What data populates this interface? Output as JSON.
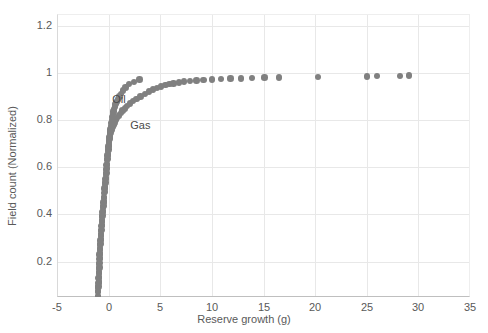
{
  "chart_data": {
    "type": "scatter",
    "title": "",
    "xlabel": "Reserve growth (g)",
    "ylabel": "Field count (Normalized)",
    "xlim": [
      -5,
      35
    ],
    "ylim": [
      0.05,
      1.25
    ],
    "xticks": [
      -5,
      0,
      5,
      10,
      15,
      20,
      25,
      30,
      35
    ],
    "xtick_labels": [
      "-5",
      "0",
      "5",
      "10",
      "15",
      "20",
      "25",
      "30",
      "35"
    ],
    "yticks": [
      0.2,
      0.4,
      0.6,
      0.8,
      1,
      1.2
    ],
    "ytick_labels": [
      "0.2",
      "0.4",
      "0.6",
      "0.8",
      "1",
      "1.2"
    ],
    "grid": true,
    "legend_position": "inline-annotation",
    "marker_color": "#808080",
    "marker_size": 3.2,
    "annotations": [
      {
        "text": "Oil",
        "x": 0.35,
        "y": 0.885
      },
      {
        "text": "Gas",
        "x": 2.1,
        "y": 0.775
      }
    ],
    "series": [
      {
        "name": "Oil",
        "color": "#808080",
        "points": [
          [
            -1.02,
            0.055
          ],
          [
            -1.0,
            0.075
          ],
          [
            -0.98,
            0.095
          ],
          [
            -0.96,
            0.115
          ],
          [
            -0.94,
            0.135
          ],
          [
            -0.92,
            0.155
          ],
          [
            -0.9,
            0.175
          ],
          [
            -0.88,
            0.195
          ],
          [
            -0.86,
            0.215
          ],
          [
            -0.84,
            0.235
          ],
          [
            -0.81,
            0.255
          ],
          [
            -0.78,
            0.275
          ],
          [
            -0.75,
            0.295
          ],
          [
            -0.72,
            0.315
          ],
          [
            -0.69,
            0.335
          ],
          [
            -0.66,
            0.355
          ],
          [
            -0.62,
            0.375
          ],
          [
            -0.58,
            0.395
          ],
          [
            -0.54,
            0.415
          ],
          [
            -0.5,
            0.435
          ],
          [
            -0.46,
            0.455
          ],
          [
            -0.42,
            0.475
          ],
          [
            -0.38,
            0.495
          ],
          [
            -0.34,
            0.515
          ],
          [
            -0.3,
            0.535
          ],
          [
            -0.26,
            0.555
          ],
          [
            -0.22,
            0.575
          ],
          [
            -0.18,
            0.595
          ],
          [
            -0.14,
            0.615
          ],
          [
            -0.1,
            0.635
          ],
          [
            -0.06,
            0.655
          ],
          [
            -0.02,
            0.675
          ],
          [
            0.02,
            0.695
          ],
          [
            0.06,
            0.712
          ],
          [
            0.1,
            0.728
          ],
          [
            0.14,
            0.744
          ],
          [
            0.18,
            0.76
          ],
          [
            0.22,
            0.774
          ],
          [
            0.26,
            0.788
          ],
          [
            0.3,
            0.8
          ],
          [
            0.35,
            0.812
          ],
          [
            0.4,
            0.824
          ],
          [
            0.46,
            0.836
          ],
          [
            0.53,
            0.848
          ],
          [
            0.6,
            0.858
          ],
          [
            0.68,
            0.868
          ],
          [
            0.78,
            0.878
          ],
          [
            0.9,
            0.888
          ],
          [
            1.05,
            0.9
          ],
          [
            1.2,
            0.912
          ],
          [
            1.4,
            0.925
          ],
          [
            1.65,
            0.938
          ],
          [
            2.0,
            0.952
          ],
          [
            2.45,
            0.962
          ],
          [
            3.0,
            0.972
          ]
        ]
      },
      {
        "name": "Gas",
        "color": "#808080",
        "points": [
          [
            -1.05,
            0.05
          ],
          [
            -1.03,
            0.07
          ],
          [
            -1.01,
            0.09
          ],
          [
            -0.99,
            0.11
          ],
          [
            -0.97,
            0.13
          ],
          [
            -0.95,
            0.15
          ],
          [
            -0.93,
            0.17
          ],
          [
            -0.91,
            0.19
          ],
          [
            -0.89,
            0.21
          ],
          [
            -0.87,
            0.23
          ],
          [
            -0.85,
            0.25
          ],
          [
            -0.82,
            0.27
          ],
          [
            -0.79,
            0.29
          ],
          [
            -0.76,
            0.31
          ],
          [
            -0.73,
            0.33
          ],
          [
            -0.7,
            0.35
          ],
          [
            -0.67,
            0.37
          ],
          [
            -0.63,
            0.39
          ],
          [
            -0.59,
            0.41
          ],
          [
            -0.55,
            0.43
          ],
          [
            -0.51,
            0.45
          ],
          [
            -0.47,
            0.47
          ],
          [
            -0.43,
            0.49
          ],
          [
            -0.39,
            0.51
          ],
          [
            -0.35,
            0.53
          ],
          [
            -0.31,
            0.55
          ],
          [
            -0.27,
            0.57
          ],
          [
            -0.23,
            0.59
          ],
          [
            -0.19,
            0.61
          ],
          [
            -0.15,
            0.63
          ],
          [
            -0.11,
            0.65
          ],
          [
            -0.07,
            0.67
          ],
          [
            -0.03,
            0.688
          ],
          [
            0.02,
            0.705
          ],
          [
            0.07,
            0.72
          ],
          [
            0.13,
            0.734
          ],
          [
            0.2,
            0.747
          ],
          [
            0.28,
            0.759
          ],
          [
            0.37,
            0.77
          ],
          [
            0.47,
            0.78
          ],
          [
            0.58,
            0.79
          ],
          [
            0.7,
            0.8
          ],
          [
            0.84,
            0.81
          ],
          [
            1.0,
            0.82
          ],
          [
            1.17,
            0.83
          ],
          [
            1.36,
            0.84
          ],
          [
            1.57,
            0.85
          ],
          [
            1.8,
            0.86
          ],
          [
            2.05,
            0.87
          ],
          [
            2.35,
            0.88
          ],
          [
            2.7,
            0.89
          ],
          [
            3.1,
            0.9
          ],
          [
            3.5,
            0.912
          ],
          [
            3.9,
            0.922
          ],
          [
            4.3,
            0.93
          ],
          [
            4.7,
            0.937
          ],
          [
            5.1,
            0.943
          ],
          [
            5.5,
            0.948
          ],
          [
            5.9,
            0.952
          ],
          [
            6.3,
            0.956
          ],
          [
            6.8,
            0.96
          ],
          [
            7.3,
            0.963
          ],
          [
            7.9,
            0.966
          ],
          [
            8.5,
            0.968
          ],
          [
            9.2,
            0.97
          ],
          [
            10.0,
            0.972
          ],
          [
            10.9,
            0.974
          ],
          [
            11.8,
            0.976
          ],
          [
            12.8,
            0.977
          ],
          [
            13.9,
            0.978
          ],
          [
            15.1,
            0.98
          ],
          [
            16.5,
            0.981
          ],
          [
            20.3,
            0.983
          ],
          [
            25.0,
            0.985
          ],
          [
            26.0,
            0.987
          ],
          [
            28.2,
            0.988
          ],
          [
            29.1,
            0.99
          ]
        ]
      }
    ]
  }
}
